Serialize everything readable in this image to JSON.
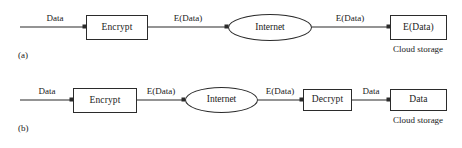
{
  "figure": {
    "type": "flow-diagram",
    "stroke_color": "#2b2b2b",
    "text_color": "#1a1a1a",
    "background_color": "#ffffff"
  },
  "panel_a": {
    "label": "(a)",
    "nodes": [
      {
        "id": "encrypt",
        "shape": "rect",
        "label": "Encrypt"
      },
      {
        "id": "internet",
        "shape": "ellipse",
        "label": "Internet"
      },
      {
        "id": "storage",
        "shape": "rect",
        "label": "E(Data)",
        "caption": "Cloud storage"
      }
    ],
    "edges": [
      {
        "from": "source",
        "to": "encrypt",
        "label": "Data"
      },
      {
        "from": "encrypt",
        "to": "internet",
        "label": "E(Data)"
      },
      {
        "from": "internet",
        "to": "storage",
        "label": "E(Data)"
      }
    ]
  },
  "panel_b": {
    "label": "(b)",
    "nodes": [
      {
        "id": "encrypt",
        "shape": "rect",
        "label": "Encrypt"
      },
      {
        "id": "internet",
        "shape": "ellipse",
        "label": "Internet"
      },
      {
        "id": "decrypt",
        "shape": "rect",
        "label": "Decrypt"
      },
      {
        "id": "storage",
        "shape": "rect",
        "label": "Data",
        "caption": "Cloud storage"
      }
    ],
    "edges": [
      {
        "from": "source",
        "to": "encrypt",
        "label": "Data"
      },
      {
        "from": "encrypt",
        "to": "internet",
        "label": "E(Data)"
      },
      {
        "from": "internet",
        "to": "decrypt",
        "label": "E(Data)"
      },
      {
        "from": "decrypt",
        "to": "storage",
        "label": "Data"
      }
    ]
  }
}
